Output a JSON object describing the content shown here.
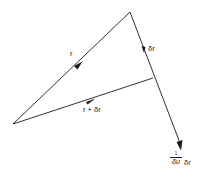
{
  "diagram": {
    "type": "vector-triangle",
    "stroke_color": "#1a1a1a",
    "background": "#ffffff",
    "points": {
      "origin": [
        13,
        124
      ],
      "r_tip": [
        130,
        12
      ],
      "r_plus_dr_tip": [
        153,
        78
      ],
      "scaled_dr_tip": [
        181,
        150
      ]
    },
    "labels": {
      "r": "r",
      "delta_r": "δr",
      "r_plus_delta_r": "r + δr",
      "scaled_numerator": "1",
      "scaled_denominator": "δu",
      "scaled_suffix": "δr"
    }
  }
}
